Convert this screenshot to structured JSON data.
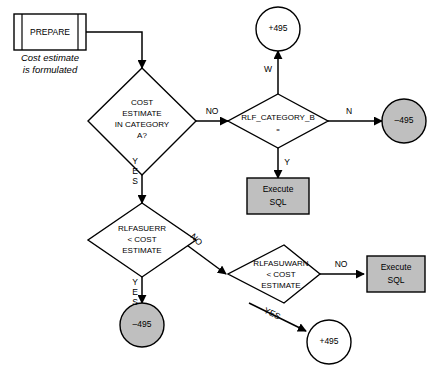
{
  "diagram": {
    "colors": {
      "shaded_fill": "#bfbfbf",
      "plain_fill": "#ffffff",
      "stroke": "#000000"
    },
    "nodes": {
      "prepare": {
        "label": "PREPARE",
        "caption_line1": "Cost estimate",
        "caption_line2": "is formulated",
        "shape": "predefined-process"
      },
      "cost_category_decision": {
        "line1": "COST",
        "line2": "ESTIMATE",
        "line3": "IN CATEGORY",
        "line4": "A?",
        "shape": "diamond"
      },
      "rlf_category_b_decision": {
        "line1": "RLF_CATEGORY_B",
        "line2": "=",
        "shape": "diamond"
      },
      "plus_495_top": {
        "label": "+495",
        "shape": "circle",
        "fill": "#ffffff"
      },
      "minus_495_right": {
        "label": "–495",
        "shape": "circle",
        "fill": "#bfbfbf"
      },
      "execute_sql_middle": {
        "line1": "Execute",
        "line2": "SQL",
        "shape": "rectangle",
        "fill": "#bfbfbf"
      },
      "rlfasuerr_decision": {
        "line1": "RLFASUERR",
        "line2": "< COST",
        "line3": "ESTIMATE",
        "shape": "diamond"
      },
      "minus_495_bottom": {
        "label": "–495",
        "shape": "circle",
        "fill": "#bfbfbf"
      },
      "rlfasuwarn_decision": {
        "line1": "RLFASUWARN",
        "line2": "< COST",
        "line3": "ESTIMATE",
        "shape": "diamond"
      },
      "execute_sql_right": {
        "line1": "Execute",
        "line2": "SQL",
        "shape": "rectangle",
        "fill": "#bfbfbf"
      },
      "plus_495_bottom": {
        "label": "+495",
        "shape": "circle",
        "fill": "#ffffff"
      }
    },
    "edges": {
      "cost_no": "NO",
      "cost_yes_l1": "Y",
      "cost_yes_l2": "E",
      "cost_yes_l3": "S",
      "rlfb_w": "W",
      "rlfb_n": "N",
      "rlfb_y": "Y",
      "rlfasuerr_no": "NO",
      "rlfasuerr_yes_l1": "Y",
      "rlfasuerr_yes_l2": "E",
      "rlfasuerr_yes_l3": "S",
      "rlfasuwarn_no": "NO",
      "rlfasuwarn_yes": "YES"
    }
  }
}
